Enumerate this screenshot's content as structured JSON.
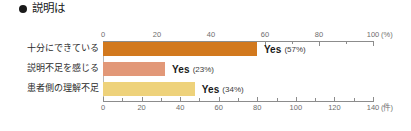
{
  "header": {
    "bullet_icon": "filled-circle-icon",
    "title": "説明は"
  },
  "chart_data": {
    "type": "bar",
    "orientation": "horizontal",
    "title": "説明は",
    "categories": [
      "十分にできている",
      "説明不足を感じる",
      "患者側の理解不足"
    ],
    "values": [
      57,
      23,
      34
    ],
    "counts": [
      81,
      33,
      48
    ],
    "value_labels": [
      "Yes (57%)",
      "Yes (23%)",
      "Yes (34%)"
    ],
    "series": [
      {
        "name": "Yes",
        "values": [
          57,
          23,
          34
        ],
        "unit": "%"
      }
    ],
    "colors": [
      "#d2791e",
      "#e29878",
      "#eed27b"
    ],
    "xlabel": "",
    "ylabel": "",
    "grid": false,
    "legend": "none",
    "top_axis": {
      "unit": "(%)",
      "ticks": [
        0,
        20,
        40,
        60,
        80,
        100
      ],
      "tick_labels": [
        "0",
        "20",
        "40",
        "60",
        "80",
        "100"
      ],
      "minor_ticks": [
        10,
        30,
        50,
        70,
        90
      ],
      "range": [
        0,
        100
      ]
    },
    "bottom_axis": {
      "unit": "(件)",
      "ticks": [
        0,
        20,
        40,
        60,
        80,
        100,
        120,
        140
      ],
      "tick_labels": [
        "0",
        "20",
        "40",
        "60",
        "80",
        "100",
        "120",
        "140"
      ],
      "minor_ticks": [
        10,
        30,
        50,
        70,
        90,
        110,
        130
      ],
      "range": [
        0,
        140
      ]
    },
    "bars": [
      {
        "label": "十分にできている",
        "percent": 57,
        "yes_text": "Yes",
        "pct_text": "(57%)",
        "color": "#d2791e"
      },
      {
        "label": "説明不足を感じる",
        "percent": 23,
        "yes_text": "Yes",
        "pct_text": "(23%)",
        "color": "#e29878"
      },
      {
        "label": "患者側の理解不足",
        "percent": 34,
        "yes_text": "Yes",
        "pct_text": "(34%)",
        "color": "#eed27b"
      }
    ]
  }
}
